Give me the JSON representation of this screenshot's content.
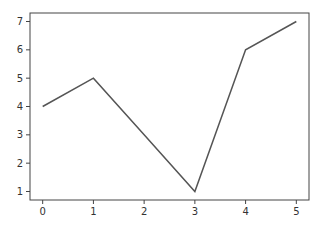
{
  "chart_data": {
    "type": "line",
    "title": "",
    "xlabel": "",
    "ylabel": "",
    "x": [
      0,
      1,
      2,
      3,
      4,
      5
    ],
    "series": [
      {
        "name": "",
        "values": [
          4,
          5,
          3,
          1,
          6,
          7
        ],
        "color": "#555555"
      }
    ],
    "xticks": [
      "0",
      "1",
      "2",
      "3",
      "4",
      "5"
    ],
    "yticks": [
      "1",
      "2",
      "3",
      "4",
      "5",
      "6",
      "7"
    ],
    "xlim": [
      -0.25,
      5.25
    ],
    "ylim": [
      0.7,
      7.3
    ],
    "grid": false,
    "legend": null
  }
}
